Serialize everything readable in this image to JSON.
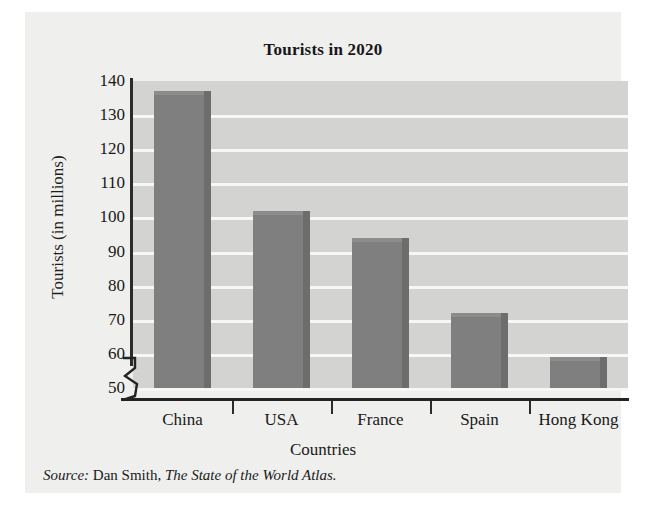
{
  "figure": {
    "title": "Tourists in 2020",
    "x_axis_label": "Countries",
    "y_axis_label": "Tourists (in millions)",
    "source": {
      "label": "Source:",
      "author": "Dan Smith,",
      "work": "The State of the World Atlas."
    },
    "colors": {
      "plot_background": "#d3d3d1",
      "figure_background": "#efefed",
      "gridline": "#f7f7f5",
      "bar_fill": "#807f7f",
      "bar_shadow": "#6e6d6d",
      "axis": "#232323",
      "text": "#191919"
    }
  },
  "chart_data": {
    "type": "bar",
    "title": "Tourists in 2020",
    "xlabel": "Countries",
    "ylabel": "Tourists (in millions)",
    "categories": [
      "China",
      "USA",
      "France",
      "Spain",
      "Hong Kong"
    ],
    "values": [
      137,
      102,
      94,
      72,
      59
    ],
    "ylim": [
      50,
      140
    ],
    "yticks": [
      50,
      60,
      70,
      80,
      90,
      100,
      110,
      120,
      130,
      140
    ],
    "ytick_labels": [
      "50",
      "60",
      "70",
      "80",
      "90",
      "100",
      "110",
      "120",
      "130",
      "140"
    ],
    "grid": true,
    "grid_axis": "y",
    "axis_break": true,
    "legend": "none",
    "source_note": "Source: Dan Smith, The State of the World Atlas."
  }
}
